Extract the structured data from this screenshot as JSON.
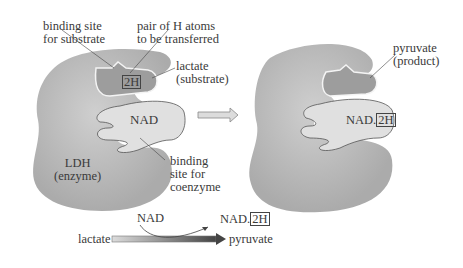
{
  "left_panel": {
    "binding_site_substrate": [
      "binding site",
      "for substrate"
    ],
    "pair_h_atoms": [
      "pair of H atoms",
      "to be transferred"
    ],
    "lactate": [
      "lactate",
      "(substrate)"
    ],
    "two_h": "2H",
    "nad": "NAD",
    "enzyme": [
      "LDH",
      "(enzyme)"
    ],
    "binding_site_coenzyme": [
      "binding",
      "site for",
      "coenzyme"
    ]
  },
  "right_panel": {
    "pyruvate": [
      "pyruvate",
      "(product)"
    ],
    "nad_prefix": "NAD.",
    "two_h": "2H"
  },
  "reaction": {
    "substrate": "lactate",
    "product": "pyruvate",
    "coenzyme_in": "NAD",
    "coenzyme_out_prefix": "NAD.",
    "coenzyme_out_box": "2H"
  },
  "colors": {
    "enzyme": "#b9b9b9",
    "substrate": "#9c9c9c",
    "coenzyme": "#e2e2e2",
    "outline": "#555555"
  }
}
